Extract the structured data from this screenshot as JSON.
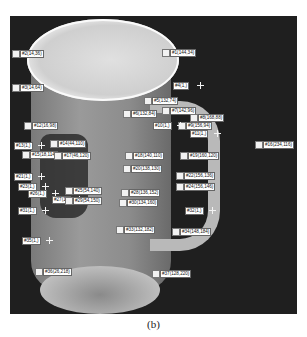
{
  "figure": {
    "caption": "(b)"
  },
  "labels": [
    {
      "text": "#2(14,36)",
      "x": 20,
      "y": 53
    },
    {
      "text": "#3(14,64)",
      "x": 20,
      "y": 87
    },
    {
      "text": "#1(144,34)",
      "x": 170,
      "y": 52
    },
    {
      "text": "#4(1,)",
      "x": 173,
      "y": 85
    },
    {
      "text": "#5(132,74)",
      "x": 152,
      "y": 100
    },
    {
      "text": "#6(132,84)",
      "x": 131,
      "y": 113
    },
    {
      "text": "#7(142,96)",
      "x": 170,
      "y": 110
    },
    {
      "text": "#8(168,88)",
      "x": 198,
      "y": 117
    },
    {
      "text": "#9(156,94)",
      "x": 186,
      "y": 125
    },
    {
      "text": "#10(1,)",
      "x": 153,
      "y": 125
    },
    {
      "text": "#11(1,)",
      "x": 190,
      "y": 133
    },
    {
      "text": "#12(16,98)",
      "x": 32,
      "y": 125
    },
    {
      "text": "#14(44,110)",
      "x": 58,
      "y": 143
    },
    {
      "text": "#13(1,)",
      "x": 14,
      "y": 145
    },
    {
      "text": "#15(18,114)",
      "x": 30,
      "y": 154
    },
    {
      "text": "#17(46,120)",
      "x": 62,
      "y": 155
    },
    {
      "text": "#18(140,110)",
      "x": 133,
      "y": 155
    },
    {
      "text": "#19(160,120)",
      "x": 188,
      "y": 155
    },
    {
      "text": "#16(234,116)",
      "x": 263,
      "y": 144
    },
    {
      "text": "#20(138,130)",
      "x": 131,
      "y": 168
    },
    {
      "text": "#21(1,)",
      "x": 14,
      "y": 176
    },
    {
      "text": "#22(156,136)",
      "x": 184,
      "y": 175
    },
    {
      "text": "#23(1,)",
      "x": 18,
      "y": 186
    },
    {
      "text": "#24(156,146)",
      "x": 184,
      "y": 186
    },
    {
      "text": "#25(54,140)",
      "x": 73,
      "y": 190
    },
    {
      "text": "#26(1,)",
      "x": 28,
      "y": 193
    },
    {
      "text": "#27(1,)",
      "x": 52,
      "y": 199
    },
    {
      "text": "#28(136,152)",
      "x": 129,
      "y": 192
    },
    {
      "text": "#29(54,150)",
      "x": 73,
      "y": 200
    },
    {
      "text": "#30(134,160)",
      "x": 127,
      "y": 202
    },
    {
      "text": "#31(1,)",
      "x": 18,
      "y": 210
    },
    {
      "text": "#32(1,)",
      "x": 185,
      "y": 210
    },
    {
      "text": "#33(132,182)",
      "x": 124,
      "y": 229
    },
    {
      "text": "#34(148,184)",
      "x": 180,
      "y": 231
    },
    {
      "text": "#35(1,)",
      "x": 22,
      "y": 240
    },
    {
      "text": "#36(26,218)",
      "x": 43,
      "y": 271
    },
    {
      "text": "#37(128,220)",
      "x": 160,
      "y": 273
    }
  ]
}
